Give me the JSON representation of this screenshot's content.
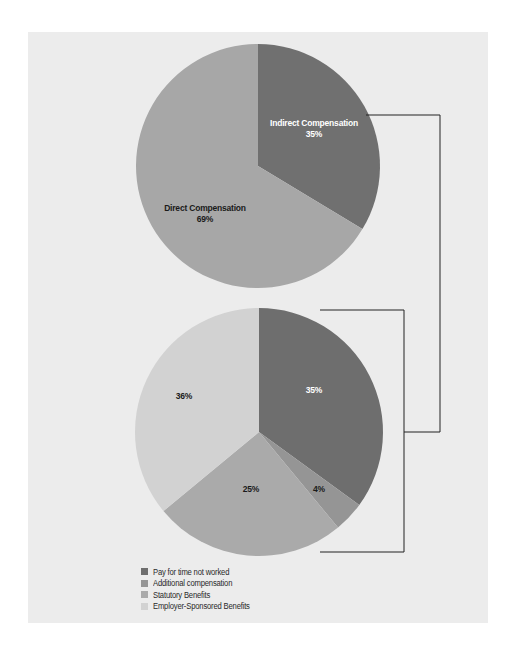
{
  "chart_data": [
    {
      "type": "pie",
      "title": "",
      "start": "12 o'clock, clockwise",
      "slices": [
        {
          "label": "Indirect Compensation",
          "value": 35,
          "display": "35%",
          "color": "#707070",
          "label_color": "#ffffff"
        },
        {
          "label": "Direct Compensation",
          "value": 69,
          "display": "69%",
          "color": "#a7a7a7",
          "label_color": "#1a1a1a"
        }
      ]
    },
    {
      "type": "pie",
      "title": "",
      "start": "12 o'clock, clockwise",
      "breakdown_of": "Indirect Compensation",
      "slices": [
        {
          "label": "Pay for time not worked",
          "value": 35,
          "display": "35%",
          "color": "#6e6e6e",
          "label_color": "#ffffff"
        },
        {
          "label": "Additional compensation",
          "value": 4,
          "display": "4%",
          "color": "#959595",
          "label_color": "#1a1a1a"
        },
        {
          "label": "Statutory Benefits",
          "value": 25,
          "display": "25%",
          "color": "#aaaaaa",
          "label_color": "#1a1a1a"
        },
        {
          "label": "Employer-Sponsored Benefits",
          "value": 36,
          "display": "36%",
          "color": "#d2d2d2",
          "label_color": "#1a1a1a"
        }
      ]
    }
  ],
  "legend": {
    "placement": "bottom-left",
    "items": [
      {
        "label": "Pay for time not worked",
        "color": "#6e6e6e"
      },
      {
        "label": "Additional compensation",
        "color": "#959595"
      },
      {
        "label": "Statutory Benefits",
        "color": "#aaaaaa"
      },
      {
        "label": "Employer-Sponsored Benefits",
        "color": "#d2d2d2"
      }
    ]
  },
  "colors": {
    "background": "#ececec",
    "connector": "#222222"
  }
}
